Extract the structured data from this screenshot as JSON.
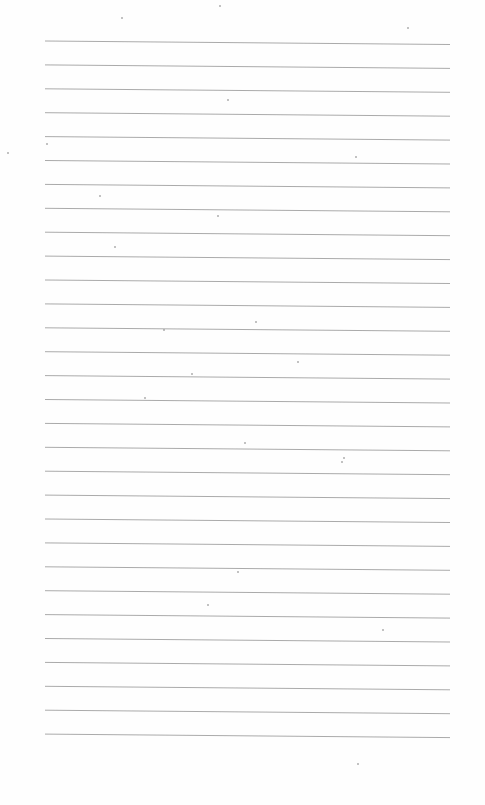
{
  "page": {
    "type": "blank lined paper",
    "background_color": "#fefefe",
    "line_color": "#a0a0a0",
    "line_count": 30,
    "first_line_y": 41,
    "line_spacing": 23.9,
    "line_left_x": 45,
    "line_right_x": 450,
    "right_end_drop": 3.5
  },
  "speckles": [
    [
      122,
      18
    ],
    [
      220,
      6
    ],
    [
      408,
      28
    ],
    [
      8,
      153
    ],
    [
      47,
      144
    ],
    [
      100,
      196
    ],
    [
      218,
      216
    ],
    [
      115,
      247
    ],
    [
      256,
      322
    ],
    [
      298,
      362
    ],
    [
      192,
      374
    ],
    [
      245,
      443
    ],
    [
      342,
      462
    ],
    [
      344,
      458
    ],
    [
      238,
      572
    ],
    [
      208,
      605
    ],
    [
      383,
      630
    ],
    [
      358,
      764
    ],
    [
      228,
      100
    ],
    [
      356,
      157
    ],
    [
      164,
      330
    ],
    [
      145,
      398
    ]
  ]
}
